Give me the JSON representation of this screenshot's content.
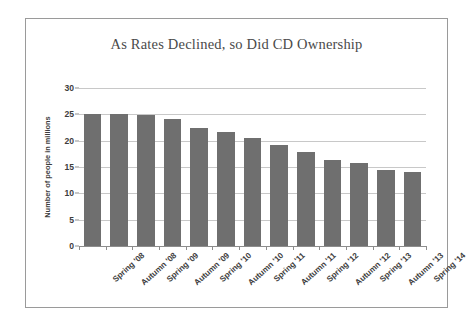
{
  "chart_data": {
    "type": "bar",
    "title": "As Rates Declined, so Did CD Ownership",
    "xlabel": "",
    "ylabel": "Number of people in millions",
    "categories": [
      "Spring '08",
      "Autumn '08",
      "Spring '09",
      "Autumn '09",
      "Spring '10",
      "Autumn '10",
      "Spring '11",
      "Autumn '11",
      "Spring '12",
      "Autumn '12",
      "Spring '13",
      "Autumn '13",
      "Spring '14"
    ],
    "values": [
      25.0,
      25.0,
      24.8,
      24.1,
      22.4,
      21.7,
      20.6,
      19.1,
      17.8,
      16.4,
      15.7,
      14.5,
      14.1
    ],
    "ylim": [
      0,
      30
    ],
    "yticks": [
      0,
      5,
      10,
      15,
      20,
      25,
      30
    ],
    "ytick_labels": [
      "0",
      "5",
      "10",
      "15",
      "20",
      "25",
      "30"
    ],
    "grid": true,
    "legend": false,
    "bar_color": "#6f6f6f",
    "grid_color": "#c8c8c8",
    "axis_color": "#8d8d8d",
    "title_color": "#4a4a4a",
    "text_color": "#3d3d3d",
    "background": "#ffffff",
    "frame_color": "#9a9a9a"
  }
}
